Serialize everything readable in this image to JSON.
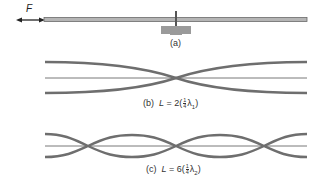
{
  "diagram": {
    "type": "vibrating rod mode shapes",
    "colors": {
      "curve": "#6e6e6e",
      "axis": "#555555",
      "support": "#9a9a9a",
      "text": "#333333"
    },
    "panel_a": {
      "force_label": "F",
      "caption": "(a)",
      "elements": [
        "double-headed force arrow",
        "horizontal rod",
        "central clamp support"
      ]
    },
    "panel_b": {
      "caption_prefix": "(b)",
      "caption_var": "L",
      "caption_eq": " = 2(",
      "frac_num": "1",
      "frac_den": "4",
      "caption_lambda": "λ",
      "caption_sub": "1",
      "caption_close": ")",
      "nodes": 1,
      "antinodes": 2
    },
    "panel_c": {
      "caption_prefix": "(c)",
      "caption_var": "L",
      "caption_eq": " = 6(",
      "frac_num": "1",
      "frac_den": "4",
      "caption_lambda": "λ",
      "caption_sub": "2",
      "caption_close": ")",
      "nodes": 3,
      "antinodes": 4
    }
  }
}
